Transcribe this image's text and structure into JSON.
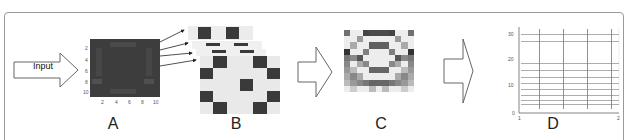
{
  "figure": {
    "input_label": "Input",
    "panels": [
      {
        "id": "A",
        "label": "A",
        "description": "Input image matrix (10x10 heatmap)"
      },
      {
        "id": "B",
        "label": "B",
        "description": "Stack of filtered feature maps"
      },
      {
        "id": "C",
        "label": "C",
        "description": "Combined grayscale pattern"
      },
      {
        "id": "D",
        "label": "D",
        "description": "Spike raster output"
      }
    ],
    "panel_a": {
      "yticks": [
        "2",
        "4",
        "6",
        "8",
        "10"
      ],
      "xticks": [
        "2",
        "4",
        "6",
        "8",
        "10"
      ],
      "bg_color": "#3d3d3d"
    },
    "panel_d": {
      "yticks": [
        "30",
        "20",
        "10",
        "0"
      ],
      "xticks": [
        "1",
        "2"
      ]
    },
    "colors": {
      "dark": "#3a3a3a",
      "light": "#e8e8e8",
      "border": "#9a9a9a"
    }
  }
}
